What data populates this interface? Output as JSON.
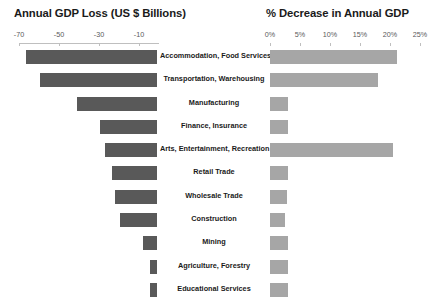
{
  "chart_data": {
    "type": "bar",
    "title": "",
    "panels": [
      {
        "title": "Annual GDP Loss (US $ Billions)",
        "xlabel": "",
        "ylabel": "",
        "axis_ticks": [
          -70,
          -50,
          -30,
          -10
        ],
        "axis_tick_labels": [
          "-70",
          "-50",
          "-30",
          "-10"
        ],
        "xlim": [
          -70,
          0
        ],
        "direction": "left",
        "bar_color": "#595959",
        "values": [
          -65.5,
          -58.5,
          -40.0,
          -28.5,
          -26.0,
          -22.5,
          -21.0,
          -18.5,
          -7.0,
          -3.5,
          -3.5
        ]
      },
      {
        "title": "% Decrease in Annual GDP",
        "xlabel": "",
        "ylabel": "",
        "axis_ticks": [
          0,
          5,
          10,
          15,
          20,
          25
        ],
        "axis_tick_labels": [
          "0%",
          "5%",
          "10%",
          "15%",
          "20%",
          "25%"
        ],
        "xlim": [
          0,
          25
        ],
        "direction": "right",
        "bar_color": "#a6a6a6",
        "values": [
          21.2,
          18.0,
          3.0,
          3.0,
          20.5,
          3.0,
          2.8,
          2.5,
          3.0,
          3.0,
          3.0
        ]
      }
    ],
    "categories": [
      "Accommodation, Food Services",
      "Transportation, Warehousing",
      "Manufacturing",
      "Finance, Insurance",
      "Arts, Entertainment, Recreation",
      "Retail Trade",
      "Wholesale Trade",
      "Construction",
      "Mining",
      "Agriculture, Forestry",
      "Educational Services"
    ],
    "grid": false,
    "legend": "none"
  }
}
